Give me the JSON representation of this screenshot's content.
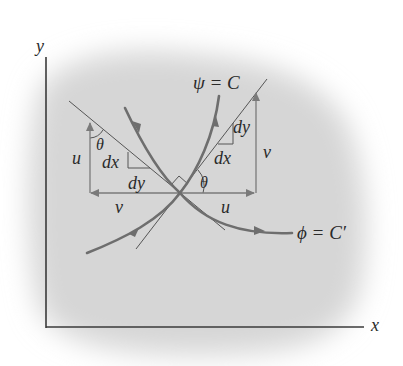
{
  "figure": {
    "axes": {
      "x_label": "x",
      "y_label": "y"
    },
    "curves": {
      "streamline_label": "ψ = C",
      "potential_line_label": "ϕ = C′"
    },
    "left_triangle": {
      "vertical_component_label": "u",
      "horizontal_component_label": "v",
      "angle_label": "θ",
      "dx_label": "dx",
      "dy_label": "dy"
    },
    "right_triangle": {
      "vertical_component_label": "v",
      "horizontal_component_label": "u",
      "angle_label": "θ",
      "dx_label": "dx",
      "dy_label": "dy"
    },
    "colors": {
      "background_blob": "#d9d9d9",
      "axis": "#3a3a3a",
      "curve": "#6e6e6e",
      "thin_line": "#555555",
      "vector": "#7a7a7a",
      "text": "#2a2a2a"
    }
  }
}
